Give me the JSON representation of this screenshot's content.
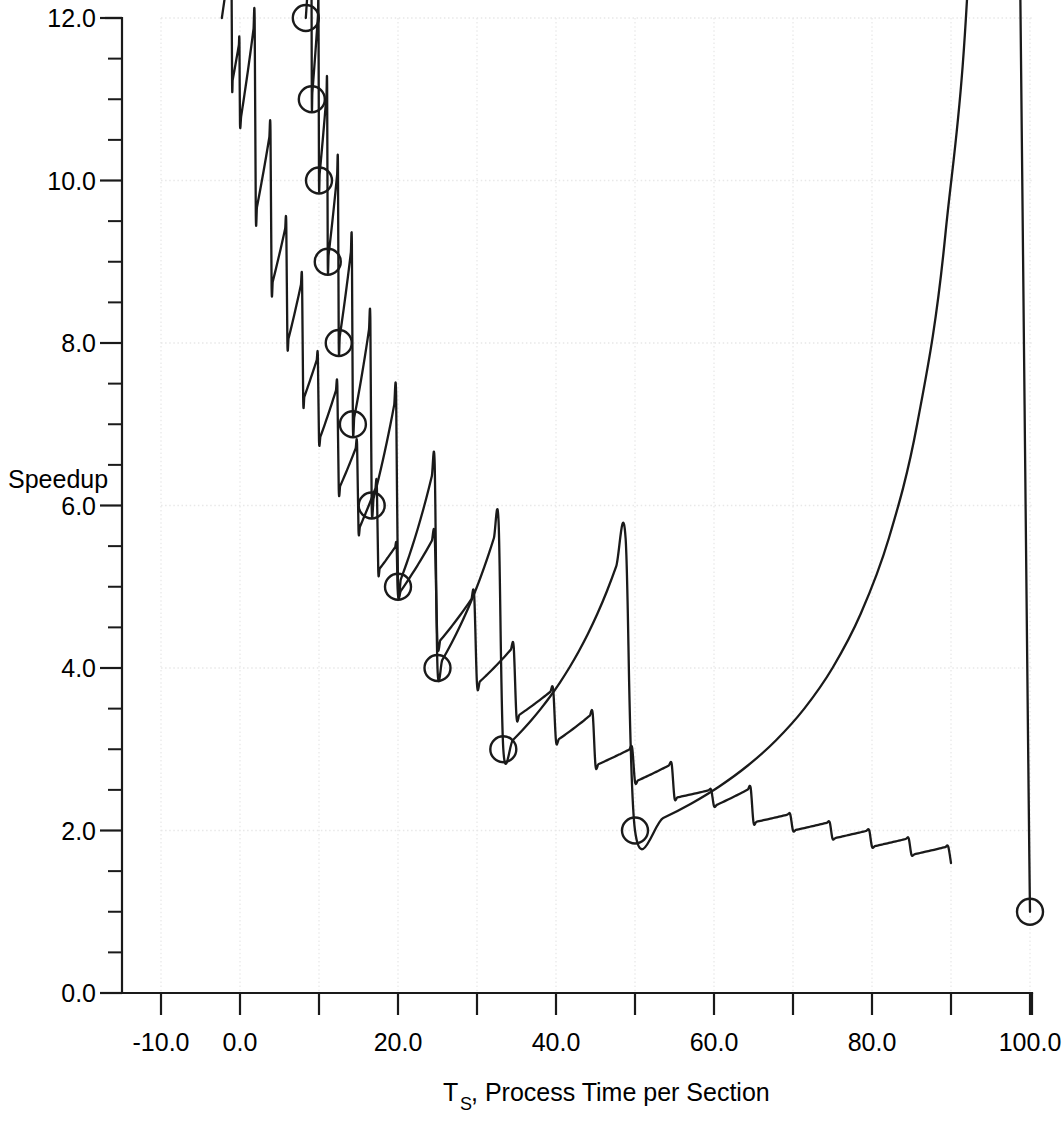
{
  "chart_data": {
    "type": "line",
    "title": "",
    "xlabel": "T_S, Process Time per Section",
    "xlabel_main": "T",
    "xlabel_sub": "S",
    "xlabel_rest": ", Process Time per Section",
    "ylabel": "Speedup",
    "xlim": [
      -15,
      104
    ],
    "ylim": [
      0.0,
      12.0
    ],
    "x_tick_step": 10,
    "x_tick_labels": [
      "-10.0",
      "0.0",
      "20.0",
      "40.0",
      "60.0",
      "80.0",
      "100.0"
    ],
    "x_tick_label_values": [
      -10,
      0,
      20,
      40,
      60,
      80,
      100
    ],
    "x_tick_values": [
      -10,
      0,
      10,
      20,
      30,
      40,
      50,
      60,
      70,
      80,
      90,
      100
    ],
    "y_tick_labels": [
      "0.0",
      "2.0",
      "4.0",
      "6.0",
      "8.0",
      "10.0",
      "12.0"
    ],
    "y_tick_label_values": [
      0,
      2,
      4,
      6,
      8,
      10,
      12
    ],
    "y_tick_step": 0.5,
    "grid": true,
    "grid_style": "dotted",
    "legend": "none",
    "marker_shape": "open-circle",
    "marker_radius_px": 13,
    "line_color": "#1a1a1a",
    "background_color": "#ffffff",
    "series": [
      {
        "name": "measured speedup",
        "formula": "S = 100 / T_S",
        "has_markers": true,
        "x": [
          8.33,
          9.09,
          10.0,
          11.11,
          12.5,
          14.29,
          16.67,
          20.0,
          25.0,
          33.33,
          50.0,
          100.0
        ],
        "y": [
          12.0,
          11.0,
          10.0,
          9.0,
          8.0,
          7.0,
          6.0,
          5.0,
          4.0,
          3.0,
          2.0,
          1.0
        ]
      },
      {
        "name": "lower curve",
        "formula": "S = 100 / (T_S + 8)",
        "has_markers": false,
        "x": [
          -2.3,
          -1.0,
          0.0,
          2.0,
          4.0,
          6.0,
          8.0,
          10.0,
          12.5,
          15.0,
          17.5,
          20.0,
          25.0,
          30.0,
          35.0,
          40.0,
          45.0,
          50.0,
          55.0,
          60.0,
          65.0,
          70.0,
          75.0,
          80.0,
          85.0,
          90.0
        ],
        "y": [
          12.0,
          11.2,
          10.7,
          9.6,
          8.7,
          8.0,
          7.3,
          6.8,
          6.2,
          5.7,
          5.2,
          4.9,
          4.3,
          3.8,
          3.4,
          3.1,
          2.8,
          2.6,
          2.4,
          2.3,
          2.1,
          2.0,
          1.9,
          1.8,
          1.7,
          1.6
        ]
      }
    ]
  },
  "labels": {
    "y_axis_title": "Speedup"
  }
}
